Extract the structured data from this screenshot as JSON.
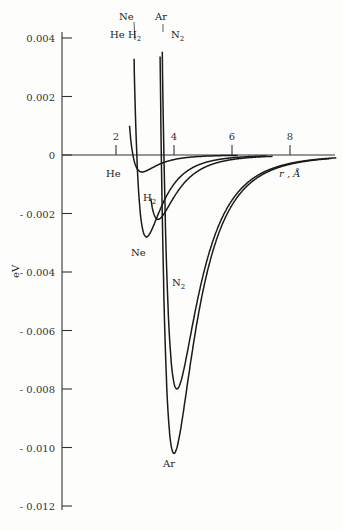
{
  "chart_data": {
    "type": "line",
    "title": "",
    "xlabel": "r , Å",
    "ylabel": "eV",
    "xlim": [
      0,
      9.6
    ],
    "ylim": [
      -0.012,
      0.004
    ],
    "grid": false,
    "legend": "inline labels",
    "x_ticks": [
      "2",
      "4",
      "6",
      "8"
    ],
    "y_ticks": [
      "0.004",
      "0.002",
      "0",
      "- 0.002",
      "- 0.004",
      "- 0.006",
      "- 0.008",
      "- 0.010",
      "- 0.012"
    ],
    "series": [
      {
        "name": "He",
        "sigma": 2.6,
        "r_min": 2.9,
        "depth": -0.00058,
        "label": "He"
      },
      {
        "name": "Ne",
        "sigma": 2.55,
        "r_min": 3.05,
        "depth": -0.0028,
        "label": "Ne"
      },
      {
        "name": "H2",
        "sigma": 2.9,
        "r_min": 3.45,
        "depth": -0.0022,
        "label": "H₂"
      },
      {
        "name": "Ar",
        "sigma": 3.6,
        "r_min": 4.0,
        "depth": -0.0102,
        "label": "Ar"
      },
      {
        "name": "N2",
        "sigma": 3.8,
        "r_min": 4.1,
        "depth": -0.008,
        "label": "N₂"
      }
    ]
  },
  "labels": {
    "top_ne": "Ne",
    "top_ar": "Ar",
    "top_he": "He",
    "top_h2": "H",
    "top_h2_sub": "2",
    "top_n2": "N",
    "top_n2_sub": "2",
    "he_below": "He",
    "h2_mid": "H",
    "h2_mid_sub": "2",
    "ne_mid": "Ne",
    "n2_mid": "N",
    "n2_mid_sub": "2",
    "ar_bottom": "Ar",
    "x_axis_label": "r , Å",
    "y_axis_label": "eV"
  }
}
